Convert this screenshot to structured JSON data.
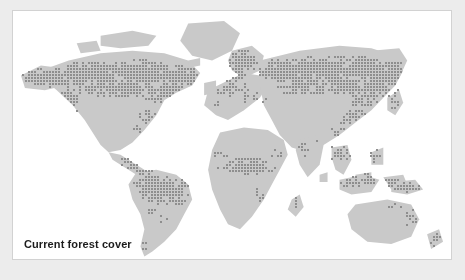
{
  "figure": {
    "caption": "Current forest cover",
    "panel_background": "#ffffff",
    "outer_background": "#ececec",
    "border_color": "#d2d2d2"
  },
  "chart_data": {
    "type": "map",
    "title": "Current forest cover",
    "subtitle": "",
    "xlabel": "",
    "ylabel": "",
    "legend_position": "none",
    "grid": false,
    "projection": "equirectangular-like world map",
    "colors": {
      "land": "#c9c9c9",
      "forest_dot": "#8e8e8e",
      "ocean": "#ffffff",
      "caption_text": "#1c1c1c"
    },
    "dot_grid": {
      "cell": 3,
      "dot_size": 2
    },
    "regions": [
      {
        "name": "North American boreal forest",
        "forested": true
      },
      {
        "name": "Alaska",
        "forested": true
      },
      {
        "name": "Canada boreal belt",
        "forested": true
      },
      {
        "name": "US Pacific Northwest",
        "forested": true
      },
      {
        "name": "US Southeast",
        "forested": true
      },
      {
        "name": "Greenland",
        "forested": false
      },
      {
        "name": "Central America",
        "forested": true
      },
      {
        "name": "Amazon basin",
        "forested": true
      },
      {
        "name": "Southern Chile",
        "forested": true
      },
      {
        "name": "Scandinavia",
        "forested": true
      },
      {
        "name": "Central Europe",
        "forested": true
      },
      {
        "name": "Siberia taiga",
        "forested": true
      },
      {
        "name": "Russian Far East",
        "forested": true
      },
      {
        "name": "Sahara",
        "forested": false
      },
      {
        "name": "Congo basin",
        "forested": true
      },
      {
        "name": "West Africa coast",
        "forested": true
      },
      {
        "name": "Madagascar",
        "forested": true
      },
      {
        "name": "India Western Ghats",
        "forested": true
      },
      {
        "name": "Southeast Asia",
        "forested": true
      },
      {
        "name": "Indonesia",
        "forested": true
      },
      {
        "name": "New Guinea",
        "forested": true
      },
      {
        "name": "Australia interior",
        "forested": false
      },
      {
        "name": "Australia east coast",
        "forested": true
      },
      {
        "name": "New Zealand",
        "forested": true
      }
    ]
  }
}
